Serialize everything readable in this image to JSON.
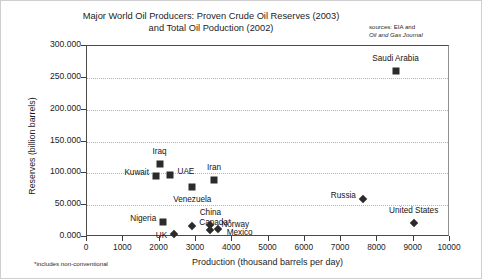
{
  "chart_data": {
    "type": "scatter",
    "title": "Major World Oil Producers: Proven Crude Oil Reserves (2003)",
    "title_line2": "and Total Oil Poduction (2002)",
    "sources_line1": "sources: EIA and",
    "sources_line2": "Oil and Gas Journal",
    "xlabel": "Production (thousand barrels per day)",
    "ylabel": "Reserves (billion barrels)",
    "footnote": "*includes non-conventional",
    "xlim": [
      0,
      10000
    ],
    "ylim": [
      0,
      300
    ],
    "xticks": [
      "0",
      "1000",
      "2000",
      "3000",
      "4000",
      "5000",
      "6000",
      "7000",
      "8000",
      "9000",
      "10000"
    ],
    "yticks": [
      "0.000",
      "50.000",
      "100.000",
      "150.000",
      "200.000",
      "250.000",
      "300.000"
    ],
    "grid": "horizontal-dotted",
    "legend": "none",
    "points": [
      {
        "label": "Saudi Arabia",
        "x": 8500,
        "y": 261.0,
        "marker": "square",
        "label_dx": 0,
        "label_dy": -13,
        "anchor": "center"
      },
      {
        "label": "Iraq",
        "x": 2000,
        "y": 115.0,
        "marker": "square",
        "label_dx": 0,
        "label_dy": -13,
        "anchor": "center"
      },
      {
        "label": "UAE",
        "x": 2300,
        "y": 97.8,
        "marker": "square",
        "label_dx": 7,
        "label_dy": -4,
        "anchor": "left"
      },
      {
        "label": "Kuwait",
        "x": 1900,
        "y": 96.5,
        "marker": "square",
        "label_dx": -7,
        "label_dy": -4,
        "anchor": "right"
      },
      {
        "label": "Iran",
        "x": 3500,
        "y": 90.0,
        "marker": "square",
        "label_dx": 0,
        "label_dy": -13,
        "anchor": "center"
      },
      {
        "label": "Venezuela",
        "x": 2900,
        "y": 77.8,
        "marker": "square",
        "label_dx": 0,
        "label_dy": 12,
        "anchor": "center"
      },
      {
        "label": "Russia",
        "x": 7600,
        "y": 60.0,
        "marker": "diamond",
        "label_dx": -7,
        "label_dy": -4,
        "anchor": "right"
      },
      {
        "label": "United States",
        "x": 9000,
        "y": 22.4,
        "marker": "diamond",
        "label_dx": 0,
        "label_dy": -13,
        "anchor": "center"
      },
      {
        "label": "Nigeria",
        "x": 2100,
        "y": 24.0,
        "marker": "square",
        "label_dx": -7,
        "label_dy": -4,
        "anchor": "right"
      },
      {
        "label": "Canada*",
        "x": 2900,
        "y": 16.8,
        "marker": "diamond",
        "label_dx": 7,
        "label_dy": -4,
        "anchor": "left"
      },
      {
        "label": "UK",
        "x": 2400,
        "y": 4.5,
        "marker": "diamond",
        "label_dx": -7,
        "label_dy": 1,
        "anchor": "right"
      },
      {
        "label": "China",
        "x": 3400,
        "y": 18.3,
        "marker": "diamond",
        "label_dx": 0,
        "label_dy": -13,
        "anchor": "center"
      },
      {
        "label": "Norway",
        "x": 3400,
        "y": 10.4,
        "marker": "diamond",
        "label_dx": 11,
        "label_dy": -6,
        "anchor": "left"
      },
      {
        "label": "Mexico",
        "x": 3600,
        "y": 12.6,
        "marker": "diamond",
        "label_dx": 9,
        "label_dy": 3,
        "anchor": "left"
      }
    ]
  }
}
